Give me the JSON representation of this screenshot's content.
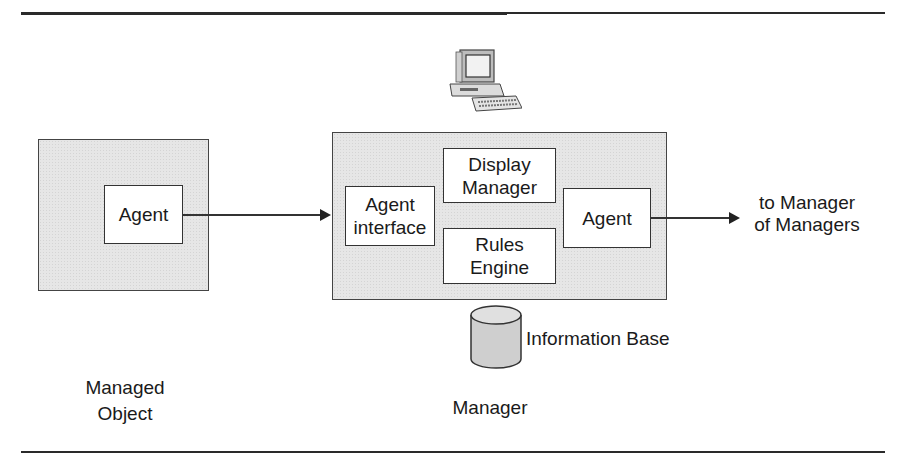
{
  "diagram": {
    "managed_object": {
      "agent_label": "Agent",
      "caption_line1": "Managed",
      "caption_line2": "Object"
    },
    "manager": {
      "agent_interface_line1": "Agent",
      "agent_interface_line2": "interface",
      "display_manager_line1": "Display",
      "display_manager_line2": "Manager",
      "rules_engine_line1": "Rules",
      "rules_engine_line2": "Engine",
      "agent_label": "Agent",
      "info_base_label": "Information Base",
      "caption": "Manager",
      "workstation_icon": "computer-workstation-icon"
    },
    "output": {
      "line1": "to Manager",
      "line2": "of Managers"
    },
    "colors": {
      "shaded_fill": "#e6e6e6",
      "stroke": "#333333"
    }
  }
}
